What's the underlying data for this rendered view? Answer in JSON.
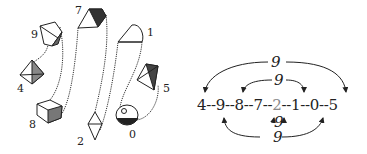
{
  "left_panel": {
    "labels": [
      {
        "text": "7",
        "x": 75,
        "y": 4
      },
      {
        "text": "1",
        "x": 147,
        "y": 26
      },
      {
        "text": "9",
        "x": 31,
        "y": 28
      },
      {
        "text": "4",
        "x": 17,
        "y": 82
      },
      {
        "text": "5",
        "x": 163,
        "y": 82
      },
      {
        "text": "8",
        "x": 29,
        "y": 118
      },
      {
        "text": "0",
        "x": 129,
        "y": 128
      },
      {
        "text": "2",
        "x": 77,
        "y": 135
      }
    ],
    "dice_order": [
      "4",
      "9",
      "8",
      "7",
      "2",
      "1",
      "0",
      "5"
    ]
  },
  "right_panel": {
    "sequence": [
      "4",
      "9",
      "8",
      "7",
      "2",
      "1",
      "0",
      "5"
    ],
    "separator": "--",
    "highlighted": "2",
    "arc_labels": {
      "outer_top": "9",
      "inner_top": "9",
      "inner_bottom": "9",
      "outer_bottom": "9"
    }
  },
  "colors": {
    "ink": "#222222",
    "highlight": "#888888"
  }
}
